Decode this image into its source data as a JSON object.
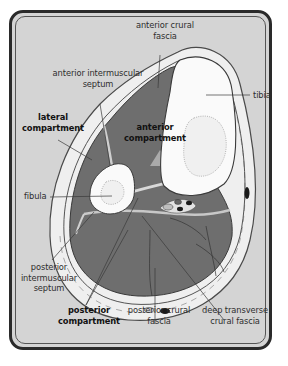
{
  "diagram": {
    "colors": {
      "background": "#d4d4d4",
      "frame": "#2a2a2a",
      "fascia_ring": "#efefef",
      "muscle": "#6e6e6e",
      "bone": "#fafafa",
      "marrow_dots": "#888888",
      "vessel_dark": "#1a1a1a",
      "text": "#2e2e2e"
    },
    "labels": {
      "anterior_crural_fascia": [
        "anterior crural",
        "fascia"
      ],
      "anterior_intermuscular_septum": [
        "anterior intermuscular",
        "septum"
      ],
      "tibia": "tibia",
      "lateral_compartment": [
        "lateral",
        "compartment"
      ],
      "anterior_compartment": [
        "anterior",
        "compartment"
      ],
      "fibula": "fibula",
      "posterior_intermuscular_septum": [
        "posterior",
        "intermuscular",
        "septum"
      ],
      "posterior_compartment": [
        "posterior",
        "compartment"
      ],
      "posterior_crural_fascia": [
        "posterior crural",
        "fascia"
      ],
      "deep_transverse_crural_fascia": [
        "deep transverse",
        "crural fascia"
      ]
    }
  }
}
